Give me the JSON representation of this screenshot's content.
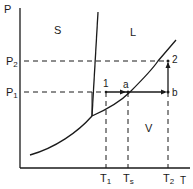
{
  "diagram": {
    "type": "phase-diagram",
    "axes": {
      "y_label": "P",
      "x_label": "T"
    },
    "regions": {
      "solid": "S",
      "liquid": "L",
      "vapor": "V"
    },
    "pressure_levels": [
      {
        "name": "P",
        "sub": "2"
      },
      {
        "name": "P",
        "sub": "1"
      }
    ],
    "temperature_levels": [
      {
        "name": "T",
        "sub": "1"
      },
      {
        "name": "T",
        "sub": "s"
      },
      {
        "name": "T",
        "sub": "2"
      }
    ],
    "points": {
      "p1": "1",
      "pa": "a",
      "pb": "b",
      "p2": "2"
    },
    "path": "1 → a → b → 2",
    "colors": {
      "line": "#1a1a1a",
      "background": "#ffffff"
    }
  }
}
